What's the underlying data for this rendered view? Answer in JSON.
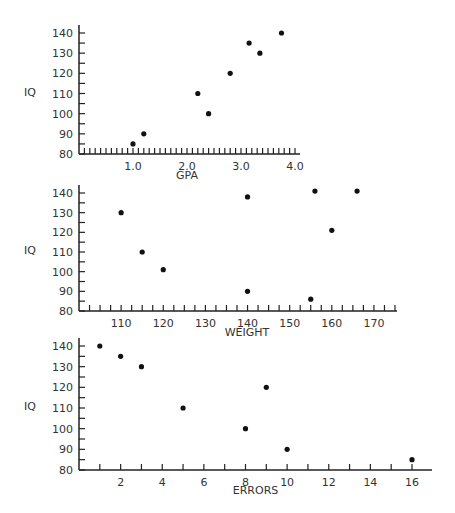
{
  "chart_data": [
    {
      "type": "scatter",
      "title": "",
      "xlabel": "GPA",
      "ylabel": "IQ",
      "xlim": [
        0,
        4.0
      ],
      "ylim": [
        80,
        140
      ],
      "xticks": [
        "1.0",
        "2.0",
        "3.0",
        "4.0"
      ],
      "yticks": [
        "80",
        "90",
        "100",
        "110",
        "120",
        "130",
        "140"
      ],
      "points": [
        [
          1.0,
          85
        ],
        [
          1.2,
          90
        ],
        [
          2.2,
          110
        ],
        [
          2.4,
          100
        ],
        [
          2.8,
          120
        ],
        [
          3.15,
          135
        ],
        [
          3.35,
          130
        ],
        [
          3.75,
          140
        ]
      ],
      "grid": false
    },
    {
      "type": "scatter",
      "title": "",
      "xlabel": "WEIGHT",
      "ylabel": "IQ",
      "xlim": [
        100,
        175
      ],
      "ylim": [
        80,
        140
      ],
      "xticks": [
        "110",
        "120",
        "130",
        "140",
        "150",
        "160",
        "170"
      ],
      "yticks": [
        "80",
        "90",
        "100",
        "110",
        "120",
        "130",
        "140"
      ],
      "points": [
        [
          110,
          130
        ],
        [
          115,
          110
        ],
        [
          120,
          101
        ],
        [
          140,
          138
        ],
        [
          140,
          90
        ],
        [
          155,
          86
        ],
        [
          156,
          141
        ],
        [
          160,
          121
        ],
        [
          166,
          141
        ]
      ],
      "grid": false
    },
    {
      "type": "scatter",
      "title": "",
      "xlabel": "ERRORS",
      "ylabel": "IQ",
      "xlim": [
        0,
        16
      ],
      "ylim": [
        80,
        140
      ],
      "xticks": [
        "2",
        "4",
        "6",
        "8",
        "10",
        "12",
        "14",
        "16"
      ],
      "yticks": [
        "80",
        "90",
        "100",
        "110",
        "120",
        "130",
        "140"
      ],
      "points": [
        [
          1,
          140
        ],
        [
          2,
          135
        ],
        [
          3,
          130
        ],
        [
          5,
          110
        ],
        [
          8,
          100
        ],
        [
          9,
          120
        ],
        [
          10,
          90
        ],
        [
          16,
          85
        ]
      ],
      "grid": false
    }
  ]
}
